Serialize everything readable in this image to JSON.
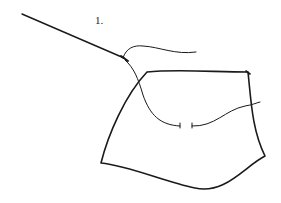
{
  "figure": {
    "step_label": "1.",
    "colors": {
      "ink": "#1a1a1a",
      "background": "#ffffff"
    }
  }
}
